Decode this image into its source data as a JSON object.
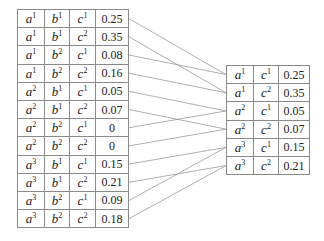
{
  "left_table": {
    "name": "joint-factor-abc",
    "rows": [
      {
        "a": "1",
        "b": "1",
        "c": "1",
        "value": "0.25",
        "maps_to": 0
      },
      {
        "a": "1",
        "b": "1",
        "c": "2",
        "value": "0.35",
        "maps_to": 1
      },
      {
        "a": "1",
        "b": "2",
        "c": "1",
        "value": "0.08",
        "maps_to": 0
      },
      {
        "a": "1",
        "b": "2",
        "c": "2",
        "value": "0.16",
        "maps_to": 1
      },
      {
        "a": "2",
        "b": "1",
        "c": "1",
        "value": "0.05",
        "maps_to": 2
      },
      {
        "a": "2",
        "b": "1",
        "c": "2",
        "value": "0.07",
        "maps_to": 3
      },
      {
        "a": "2",
        "b": "2",
        "c": "1",
        "value": "0",
        "maps_to": 2
      },
      {
        "a": "2",
        "b": "2",
        "c": "2",
        "value": "0",
        "maps_to": 3
      },
      {
        "a": "3",
        "b": "1",
        "c": "1",
        "value": "0.15",
        "maps_to": 4
      },
      {
        "a": "3",
        "b": "1",
        "c": "2",
        "value": "0.21",
        "maps_to": 5
      },
      {
        "a": "3",
        "b": "2",
        "c": "1",
        "value": "0.09",
        "maps_to": 4
      },
      {
        "a": "3",
        "b": "2",
        "c": "2",
        "value": "0.18",
        "maps_to": 5
      }
    ]
  },
  "right_table": {
    "name": "reduced-factor-ac",
    "rows": [
      {
        "a": "1",
        "c": "1",
        "value": "0.25"
      },
      {
        "a": "1",
        "c": "2",
        "value": "0.35"
      },
      {
        "a": "2",
        "c": "1",
        "value": "0.05"
      },
      {
        "a": "2",
        "c": "2",
        "value": "0.07"
      },
      {
        "a": "3",
        "c": "1",
        "value": "0.15"
      },
      {
        "a": "3",
        "c": "2",
        "value": "0.21"
      }
    ]
  },
  "variables": {
    "a": "a",
    "b": "b",
    "c": "c"
  },
  "colors": {
    "connector": "#9a9a9a",
    "border": "#3a3a3a",
    "grid": "#8a8a8a"
  }
}
